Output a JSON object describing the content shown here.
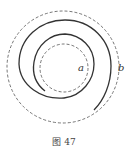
{
  "figure": {
    "caption": "图 47",
    "labels": {
      "a": "a",
      "b": "b"
    },
    "center": [
      64,
      66
    ],
    "inner_dashed_circle_radius": 24,
    "outer_dashed_circle_radius": 56,
    "spiral": "solid conductor spiral from inner end near (45,92) to outer end near (95,109)",
    "colors": {
      "line": "#333333",
      "dashed": "#666666"
    }
  }
}
